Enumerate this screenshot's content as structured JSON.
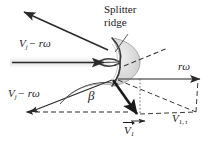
{
  "figure": {
    "background": "#ffffff",
    "stroke_color": "#2a2a2a",
    "bucket_fill": "#d8d8d8",
    "jet_band_color": "#e8e8e8"
  },
  "labels": {
    "splitter_ridge_line1": "Splitter",
    "splitter_ridge_line2": "ridge",
    "jet_upper": {
      "v": "V",
      "sub": "j",
      "rest": "− rω"
    },
    "jet_lower": {
      "v": "V",
      "sub": "j",
      "rest": "− rω"
    },
    "blade_speed": "rω",
    "angle_beta": "β",
    "exit_velocity": {
      "v": "V",
      "sub": "1"
    },
    "tangential_component": {
      "v": "V",
      "sub": "1, t"
    }
  },
  "annotations": {
    "leader_target": "splitter-ridge",
    "beta_description": "deflection angle between relative inlet and exit velocity",
    "dashed_style": "dashed",
    "dotted_style": "dotted"
  }
}
